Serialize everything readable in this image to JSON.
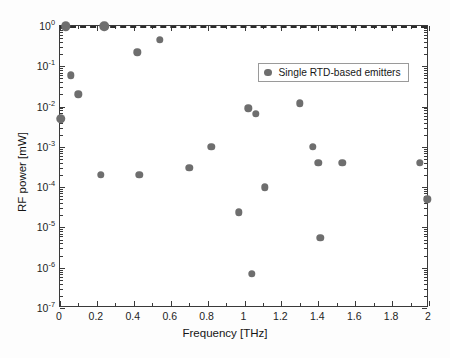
{
  "chart_data": {
    "type": "scatter",
    "title": "",
    "xlabel": "Frequency [THz]",
    "ylabel": "RF power [mW]",
    "xlim": [
      0,
      2
    ],
    "ylim": [
      1e-07,
      1
    ],
    "yscale": "log",
    "xscale": "linear",
    "grid": false,
    "legend_position": "upper right",
    "xticks": [
      0,
      0.2,
      0.4,
      0.6,
      0.8,
      1,
      1.2,
      1.4,
      1.6,
      1.8,
      2
    ],
    "xtick_labels": [
      "0",
      "0.2",
      "0.4",
      "0.6",
      "0.8",
      "1",
      "1.2",
      "1.4",
      "1.6",
      "1.8",
      "2"
    ],
    "yticks": [
      1,
      0.1,
      0.01,
      0.001,
      0.0001,
      1e-05,
      1e-06,
      1e-07
    ],
    "ytick_labels": [
      "10",
      "10",
      "10",
      "10",
      "10",
      "10",
      "10",
      "10"
    ],
    "ytick_exponents": [
      "0",
      "-1",
      "-2",
      "-3",
      "-4",
      "-5",
      "-6",
      "-7"
    ],
    "series": [
      {
        "name": "Single RTD-based emitters",
        "marker": "circle",
        "color": "#6e6e6e",
        "points": [
          {
            "x": 0.03,
            "y": 1.0
          },
          {
            "x": 0.06,
            "y": 0.06
          },
          {
            "x": 0.1,
            "y": 0.02
          },
          {
            "x": 0.005,
            "y": 0.005
          },
          {
            "x": 0.24,
            "y": 1.0
          },
          {
            "x": 0.22,
            "y": 0.0002
          },
          {
            "x": 0.42,
            "y": 0.22
          },
          {
            "x": 0.43,
            "y": 0.0002
          },
          {
            "x": 0.54,
            "y": 0.45
          },
          {
            "x": 0.7,
            "y": 0.0003
          },
          {
            "x": 0.82,
            "y": 0.001
          },
          {
            "x": 0.97,
            "y": 2.35e-05
          },
          {
            "x": 1.02,
            "y": 0.009
          },
          {
            "x": 1.06,
            "y": 0.0065
          },
          {
            "x": 1.04,
            "y": 7e-07
          },
          {
            "x": 1.11,
            "y": 0.0001
          },
          {
            "x": 1.3,
            "y": 0.012
          },
          {
            "x": 1.37,
            "y": 0.001
          },
          {
            "x": 1.4,
            "y": 0.0004
          },
          {
            "x": 1.41,
            "y": 5.5e-06
          },
          {
            "x": 1.53,
            "y": 0.0004
          },
          {
            "x": 1.95,
            "y": 0.0004
          },
          {
            "x": 1.99,
            "y": 5e-05
          }
        ]
      }
    ],
    "annotations": [
      {
        "type": "hline",
        "name": "threshold-line",
        "y": 1.0,
        "style": "dashed",
        "color": "#2b2b2b"
      }
    ]
  },
  "legend": {
    "entries": [
      {
        "label": "Single RTD-based emitters",
        "marker": "circle-marker",
        "color": "#6e6e6e"
      }
    ]
  },
  "axes": {
    "x_title": "Frequency [THz]",
    "y_title": "RF power [mW]"
  }
}
